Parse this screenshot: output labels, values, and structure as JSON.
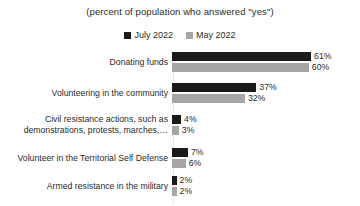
{
  "chart_data": {
    "type": "bar",
    "orientation": "horizontal",
    "title": "(percent of population who answered \"yes\")",
    "xlabel": "",
    "ylabel": "",
    "xlim": [
      0,
      65
    ],
    "grid": false,
    "legend_position": "top-center",
    "value_suffix": "%",
    "categories": [
      "Donating funds",
      "Volunteering in the community",
      "Civil resistance actions, such as\ndemonstrations, protests, marches,…",
      "Volunteer in the Territorial Self Defense",
      "Armed resistance in the military"
    ],
    "series": [
      {
        "name": "July 2022",
        "color": "#1a1a1a",
        "values": [
          61,
          37,
          4,
          7,
          2
        ],
        "labels": [
          "61%",
          "37%",
          "4%",
          "7%",
          "2%"
        ]
      },
      {
        "name": "May 2022",
        "color": "#a6a6a6",
        "values": [
          60,
          32,
          3,
          6,
          2
        ],
        "labels": [
          "60%",
          "32%",
          "3%",
          "6%",
          "2%"
        ]
      }
    ]
  },
  "legend": {
    "items": [
      {
        "label": "July 2022",
        "color": "#1a1a1a"
      },
      {
        "label": "May 2022",
        "color": "#a6a6a6"
      }
    ]
  }
}
